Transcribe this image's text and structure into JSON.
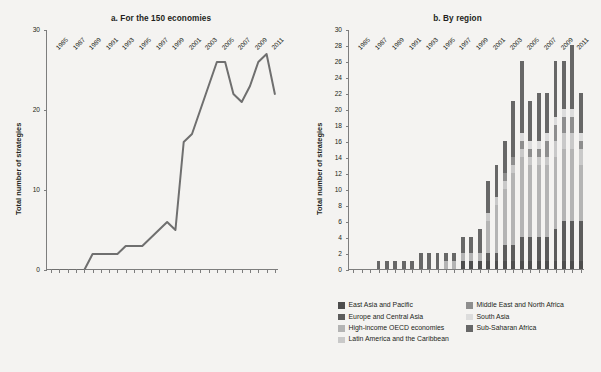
{
  "figure": {
    "background": "#f4f3f1",
    "ink": "#231f20"
  },
  "panels": {
    "a": {
      "title": "a. For the 150 economies",
      "ylabel": "Total number of strategies"
    },
    "b": {
      "title": "b. By region",
      "ylabel": "Total number of strategies"
    }
  },
  "legend": {
    "columns": [
      [
        {
          "label": "East Asia and Pacific",
          "color": "#4d4d4d"
        },
        {
          "label": "Europe and Central Asia",
          "color": "#5c5c5c"
        },
        {
          "label": "High-income OECD economies",
          "color": "#b4b4b4"
        },
        {
          "label": "Latin America and the Caribbean",
          "color": "#c9c9c9"
        }
      ],
      [
        {
          "label": "Middle East and North Africa",
          "color": "#8e8e8e"
        },
        {
          "label": "South Asia",
          "color": "#dcdcdc"
        },
        {
          "label": "Sub-Saharan Africa",
          "color": "#676767"
        }
      ]
    ]
  },
  "chart_data": [
    {
      "type": "line",
      "title": "a. For the 150 economies",
      "xlabel": "",
      "ylabel": "Total number of strategies",
      "ylim": [
        0,
        30
      ],
      "yticks": [
        0,
        10,
        20,
        30
      ],
      "grid": false,
      "legend": "none",
      "line_color": "#6f6f6f",
      "x": [
        1985,
        1986,
        1987,
        1988,
        1989,
        1990,
        1991,
        1992,
        1993,
        1994,
        1995,
        1996,
        1997,
        1998,
        1999,
        2000,
        2001,
        2002,
        2003,
        2004,
        2005,
        2006,
        2007,
        2008,
        2009,
        2010,
        2011,
        2012
      ],
      "xtick_labels": [
        1985,
        1987,
        1989,
        1991,
        1993,
        1995,
        1997,
        1999,
        2001,
        2003,
        2005,
        2007,
        2009,
        2011
      ],
      "values": [
        0,
        0,
        0,
        0,
        0,
        2,
        2,
        2,
        2,
        3,
        3,
        3,
        4,
        5,
        6,
        5,
        16,
        17,
        20,
        23,
        26,
        26,
        22,
        21,
        23,
        26,
        27,
        22
      ]
    },
    {
      "type": "bar",
      "stacked": true,
      "title": "b. By region",
      "xlabel": "",
      "ylabel": "Total number of strategies",
      "ylim": [
        0,
        30
      ],
      "yticks": [
        0,
        2,
        4,
        6,
        8,
        10,
        12,
        14,
        16,
        18,
        20,
        22,
        24,
        26,
        28,
        30
      ],
      "grid": false,
      "legend": "bottom",
      "categories": [
        1985,
        1986,
        1987,
        1988,
        1989,
        1990,
        1991,
        1992,
        1993,
        1994,
        1995,
        1996,
        1997,
        1998,
        1999,
        2000,
        2001,
        2002,
        2003,
        2004,
        2005,
        2006,
        2007,
        2008,
        2009,
        2010,
        2011,
        2012
      ],
      "xtick_labels": [
        1985,
        1987,
        1989,
        1991,
        1993,
        1995,
        1997,
        1999,
        2001,
        2003,
        2005,
        2007,
        2009,
        2011
      ],
      "series": [
        {
          "name": "East Asia and Pacific",
          "color": "#4d4d4d",
          "values": [
            0,
            0,
            0,
            0,
            0,
            0,
            0,
            0,
            0,
            0,
            0,
            0,
            0,
            1,
            1,
            1,
            1,
            1,
            1,
            1,
            1,
            1,
            1,
            1,
            1,
            1,
            1,
            1
          ]
        },
        {
          "name": "Europe and Central Asia",
          "color": "#5c5c5c",
          "values": [
            0,
            0,
            0,
            0,
            0,
            0,
            0,
            0,
            0,
            0,
            0,
            0,
            0,
            0,
            0,
            0,
            1,
            1,
            2,
            2,
            3,
            3,
            3,
            3,
            4,
            5,
            5,
            5
          ]
        },
        {
          "name": "High-income OECD economies",
          "color": "#b4b4b4",
          "values": [
            0,
            0,
            0,
            0,
            0,
            0,
            0,
            0,
            0,
            0,
            0,
            1,
            1,
            1,
            1,
            1,
            4,
            6,
            7,
            9,
            10,
            9,
            9,
            9,
            9,
            9,
            9,
            7
          ]
        },
        {
          "name": "Latin America and the Caribbean",
          "color": "#c9c9c9",
          "values": [
            0,
            0,
            0,
            0,
            0,
            0,
            0,
            0,
            0,
            0,
            0,
            0,
            0,
            0,
            0,
            0,
            1,
            1,
            1,
            1,
            1,
            1,
            1,
            1,
            2,
            2,
            2,
            2
          ]
        },
        {
          "name": "Middle East and North Africa",
          "color": "#8e8e8e",
          "values": [
            0,
            0,
            0,
            0,
            0,
            0,
            0,
            0,
            0,
            0,
            0,
            0,
            0,
            0,
            0,
            0,
            0,
            0,
            1,
            1,
            1,
            1,
            1,
            2,
            2,
            2,
            2,
            1
          ]
        },
        {
          "name": "South Asia",
          "color": "#dcdcdc",
          "values": [
            0,
            0,
            0,
            0,
            0,
            0,
            0,
            0,
            0,
            0,
            0,
            0,
            0,
            0,
            0,
            0,
            0,
            0,
            0,
            0,
            1,
            1,
            1,
            1,
            1,
            1,
            1,
            1
          ]
        },
        {
          "name": "Sub-Saharan Africa",
          "color": "#676767",
          "values": [
            0,
            0,
            0,
            1,
            1,
            1,
            1,
            1,
            2,
            2,
            2,
            1,
            1,
            2,
            2,
            3,
            4,
            4,
            4,
            7,
            9,
            5,
            6,
            5,
            7,
            6,
            8,
            5
          ]
        }
      ]
    }
  ]
}
